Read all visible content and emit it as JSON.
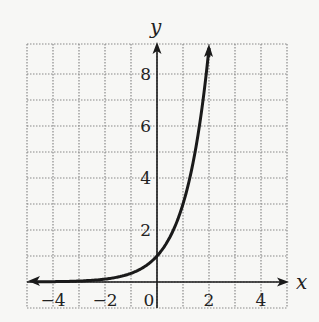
{
  "chart_data": {
    "type": "line",
    "title": "",
    "xlabel": "x",
    "ylabel": "y",
    "function": "y = 3^x",
    "xlim": [
      -5,
      5
    ],
    "ylim": [
      -1,
      9
    ],
    "grid": true,
    "grid_style": "dotted",
    "x_ticks": [
      -4,
      -2,
      0,
      2,
      4
    ],
    "x_tick_labels": [
      "−4",
      "−2",
      "0",
      "2",
      "4"
    ],
    "y_ticks": [
      2,
      4,
      6,
      8
    ],
    "y_tick_labels": [
      "2",
      "4",
      "6",
      "8"
    ],
    "series": [
      {
        "name": "curve",
        "x": [
          -5,
          -4,
          -3,
          -2,
          -1,
          0,
          0.5,
          1,
          1.5,
          2
        ],
        "y": [
          0.004,
          0.012,
          0.037,
          0.111,
          0.333,
          1,
          1.732,
          3,
          5.196,
          9
        ],
        "left_arrow": true,
        "right_arrow": true
      }
    ],
    "legend": null
  },
  "axes": {
    "x_label": "x",
    "y_label": "y"
  },
  "colors": {
    "ink": "#1a1a1a",
    "grid": "#8a8a8a",
    "background": "#f7f7f5"
  }
}
